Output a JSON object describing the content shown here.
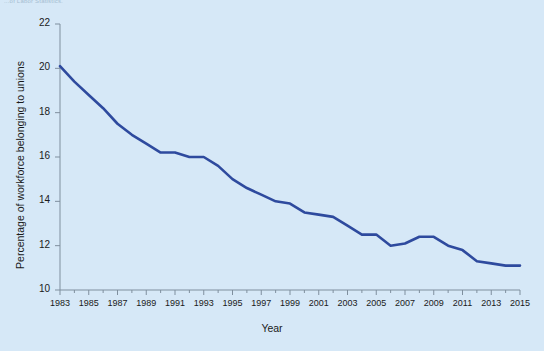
{
  "source_note": "...of Labor Statistics.",
  "chart_data": {
    "type": "line",
    "title": "",
    "xlabel": "Year",
    "ylabel": "Percentage of workforce belonging to unions",
    "xlim": [
      1983,
      2015
    ],
    "ylim": [
      10,
      22
    ],
    "ytick_step": 2,
    "xtick_step": 2,
    "minor_xticks_every": 1,
    "grid": false,
    "legend": "none",
    "line_color": "#2e4a9e",
    "background_color": "#d6e8f7",
    "axis_color": "#7f8f9e",
    "yticks": [
      10,
      12,
      14,
      16,
      18,
      20,
      22
    ],
    "xticks": [
      1983,
      1985,
      1987,
      1989,
      1991,
      1993,
      1995,
      1997,
      1999,
      2001,
      2003,
      2005,
      2007,
      2009,
      2011,
      2013,
      2015
    ],
    "x": [
      1983,
      1984,
      1985,
      1986,
      1987,
      1988,
      1989,
      1990,
      1991,
      1992,
      1993,
      1994,
      1995,
      1996,
      1997,
      1998,
      1999,
      2000,
      2001,
      2002,
      2003,
      2004,
      2005,
      2006,
      2007,
      2008,
      2009,
      2010,
      2011,
      2012,
      2013,
      2014,
      2015
    ],
    "values": [
      20.1,
      19.4,
      18.8,
      18.2,
      17.5,
      17.0,
      16.6,
      16.2,
      16.2,
      16.0,
      16.0,
      15.6,
      15.0,
      14.6,
      14.3,
      14.0,
      13.9,
      13.5,
      13.4,
      13.3,
      12.9,
      12.5,
      12.5,
      12.0,
      12.1,
      12.4,
      12.4,
      12.0,
      11.8,
      11.3,
      11.2,
      11.1,
      11.1
    ],
    "data_point_labels": []
  }
}
